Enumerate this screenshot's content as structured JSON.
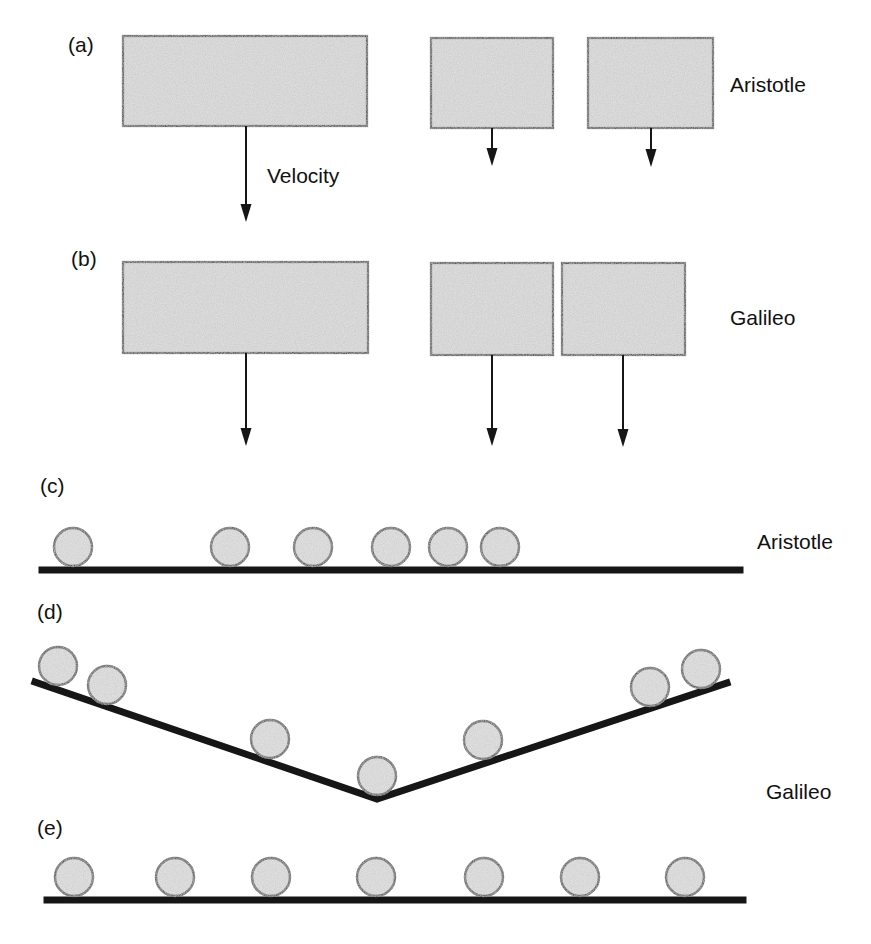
{
  "figure": {
    "sections": {
      "a": {
        "tag": "(a)",
        "side_label": "Aristotle",
        "arrow_label": "Velocity"
      },
      "b": {
        "tag": "(b)",
        "side_label": "Galileo"
      },
      "c": {
        "tag": "(c)",
        "side_label": "Aristotle"
      },
      "d": {
        "tag": "(d)",
        "side_label": "Galileo"
      },
      "e": {
        "tag": "(e)"
      }
    }
  },
  "colors": {
    "background": "#ffffff",
    "box_fill": "#c9c9c9",
    "box_border": "#2a2a2a",
    "ball_fill": "#cdcdcd",
    "ball_border": "#383838",
    "surface_line": "#161616",
    "arrow": "#161616",
    "text": "#111111"
  },
  "diagram": {
    "ball_radius": 19,
    "a": {
      "boxes": [
        [
          123,
          36,
          244,
          90
        ],
        [
          431,
          38,
          122,
          90
        ],
        [
          588,
          38,
          125,
          90
        ]
      ],
      "arrows": [
        [
          246,
          126,
          222
        ],
        [
          492,
          128,
          166
        ],
        [
          651,
          128,
          167
        ]
      ]
    },
    "b": {
      "boxes": [
        [
          123,
          262,
          245,
          91
        ],
        [
          431,
          263,
          122,
          92
        ],
        [
          562,
          263,
          123,
          92
        ]
      ],
      "arrows": [
        [
          246,
          353,
          446
        ],
        [
          492,
          355,
          446
        ],
        [
          623,
          355,
          447
        ]
      ]
    },
    "c": {
      "surface": [
        [
          42,
          570
        ],
        [
          740,
          570
        ]
      ],
      "balls": [
        [
          73,
          547
        ],
        [
          230,
          547
        ],
        [
          313,
          547
        ],
        [
          391,
          547
        ],
        [
          448,
          547
        ],
        [
          500,
          547
        ]
      ]
    },
    "d": {
      "surface": [
        [
          35,
          682
        ],
        [
          377,
          799
        ],
        [
          727,
          683
        ]
      ],
      "balls": [
        [
          58,
          666
        ],
        [
          107,
          685
        ],
        [
          270,
          739
        ],
        [
          377,
          776
        ],
        [
          483,
          740
        ],
        [
          650,
          687
        ],
        [
          701,
          669
        ]
      ]
    },
    "e": {
      "surface": [
        [
          47,
          900
        ],
        [
          743,
          900
        ]
      ],
      "balls": [
        [
          74,
          877
        ],
        [
          175,
          877
        ],
        [
          271,
          877
        ],
        [
          376,
          877
        ],
        [
          484,
          877
        ],
        [
          580,
          877
        ],
        [
          685,
          877
        ]
      ]
    }
  }
}
